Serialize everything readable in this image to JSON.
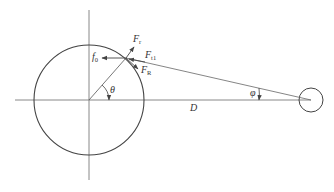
{
  "diagram": {
    "type": "geometry-force-diagram",
    "colors": {
      "line": "#444444",
      "axis": "#7a7a7a",
      "text": "#333333"
    },
    "labels": {
      "f0": {
        "main": "f",
        "sub": "0"
      },
      "Fr": {
        "main": "F",
        "sub": "r"
      },
      "Ft1": {
        "main": "F",
        "sub": "t1"
      },
      "FR": {
        "main": "F",
        "sub": "R"
      },
      "theta": "θ",
      "phi": "φ",
      "D": "D"
    },
    "geometry": {
      "big_circle": {
        "cx": 89,
        "cy": 100,
        "r": 55
      },
      "small_circle": {
        "cx": 311,
        "cy": 100,
        "r": 12
      },
      "contact_point": {
        "x": 126,
        "y": 58
      },
      "horizontal_axis": {
        "x1": 15,
        "x2": 311,
        "y": 100
      },
      "vertical_axis": {
        "x": 89,
        "y1": 10,
        "y2": 180
      }
    }
  }
}
